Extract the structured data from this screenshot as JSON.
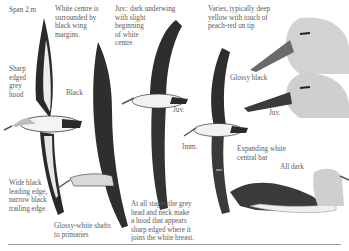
{
  "plate": {
    "subject": "Grey-headed albatross illustration plate",
    "labels": {
      "span": "Span 2 m",
      "white_centre": "White centre is\nsurrounded by\nblack wing\nmargins.",
      "juv_underwing": "Juv.: dark underwing\nwith slight\nbeginning\nof white\ncentre",
      "bill": "Varies, typically deep\nyellow with touch of\npeach-red on tip",
      "sharp_hood": "Sharp\nedged\ngrey\nhood",
      "black": "Black",
      "glossy_black": "Glossy black",
      "juv_1": "Juv.",
      "juv_2": "Juv.",
      "imm": "Imm.",
      "expanding_bar": "Expanding white\ncentral bar",
      "all_dark": "All dark",
      "leading_edge": "Wide black\nleading edge,\nnarrow black\ntrailing edge",
      "glossy_shafts": "Glossy-white shafts\nto primaries",
      "hood_note": "At all stages the grey\nhead and neck make\na hood that appears\nsharp edged where it\njoins the white breast."
    },
    "colors": {
      "background": "#ffffff",
      "ink": "#1a1a1a",
      "grey_head": "#c8c8c8",
      "text": "#5a5a5a"
    }
  }
}
